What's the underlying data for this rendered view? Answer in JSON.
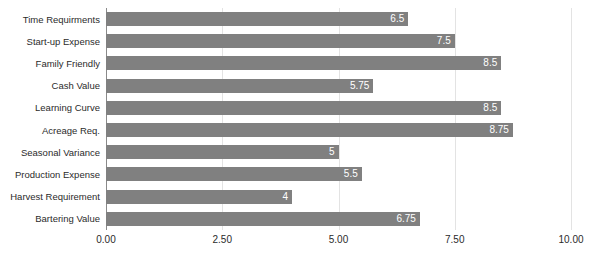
{
  "chart_data": {
    "type": "bar",
    "orientation": "horizontal",
    "title": "",
    "xlabel": "",
    "ylabel": "",
    "xlim": [
      0,
      10
    ],
    "grid": true,
    "legend": false,
    "bar_color": "#808080",
    "gridline_color": "#e3e3e3",
    "axis_color": "#8a8a8a",
    "value_label_color": "#ffffff",
    "xticks": [
      "0.00",
      "2.50",
      "5.00",
      "7.50",
      "10.00"
    ],
    "xtick_values": [
      0,
      2.5,
      5,
      7.5,
      10
    ],
    "categories": [
      "Time Requirments",
      "Start-up Expense",
      "Family Friendly",
      "Cash Value",
      "Learning Curve",
      "Acreage Req.",
      "Seasonal Variance",
      "Production Expense",
      "Harvest Requirement",
      "Bartering Value"
    ],
    "values": [
      6.5,
      7.5,
      8.5,
      5.75,
      8.5,
      8.75,
      5,
      5.5,
      4,
      6.75
    ],
    "value_labels": [
      "6.5",
      "7.5",
      "8.5",
      "5.75",
      "8.5",
      "8.75",
      "5",
      "5.5",
      "4",
      "6.75"
    ]
  }
}
